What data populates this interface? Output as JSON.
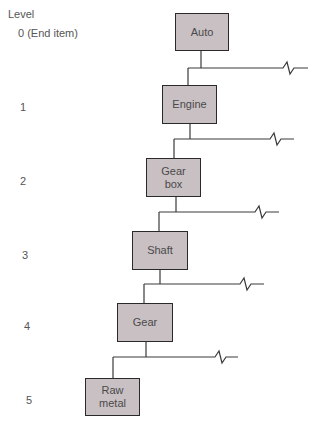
{
  "header": {
    "level_label": "Level"
  },
  "levels": [
    {
      "label": "0 (End item)",
      "item": "Auto"
    },
    {
      "label": "1",
      "item": "Engine"
    },
    {
      "label": "2",
      "item": "Gear box"
    },
    {
      "label": "3",
      "item": "Shaft"
    },
    {
      "label": "4",
      "item": "Gear"
    },
    {
      "label": "5",
      "item": "Raw metal"
    }
  ],
  "items": {
    "auto": "Auto",
    "engine": "Engine",
    "gearbox_line1": "Gear",
    "gearbox_line2": "box",
    "shaft": "Shaft",
    "gear": "Gear",
    "rawmetal_line1": "Raw",
    "rawmetal_line2": "metal"
  },
  "colors": {
    "box_fill": "#c9c0c3",
    "box_border": "#2a2a2a",
    "line": "#3a3a3a",
    "text": "#4a4a4a"
  }
}
